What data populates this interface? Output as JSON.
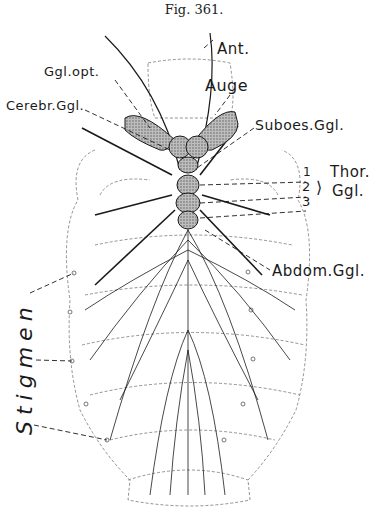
{
  "figure": {
    "caption": "Fig. 361.",
    "labels": {
      "antenna": "Ant.",
      "optic_ganglion": "Ggl.opt.",
      "eye": "Auge",
      "cerebral_ganglion": "Cerebr.Ggl.",
      "suboesophageal_ganglion": "Suboes.Ggl.",
      "thoracic_numbers": [
        "1",
        "2",
        "3"
      ],
      "thoracic_ganglia_line1": "Thor.",
      "thoracic_ganglia_line2": "Ggl.",
      "abdominal_ganglion": "Abdom.Ggl.",
      "spiracles": "Stigmen"
    },
    "colors": {
      "ink": "#1a1a1a",
      "ganglion_fill": "#9a9a9a",
      "outline": "#666666"
    }
  }
}
